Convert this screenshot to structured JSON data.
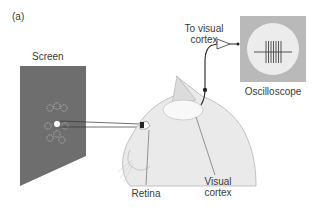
{
  "figure": {
    "panel_label": "(a)",
    "labels": {
      "screen": "Screen",
      "to_visual_cortex_line1": "To visual",
      "to_visual_cortex_line2": "cortex",
      "oscilloscope": "Oscilloscope",
      "retina": "Retina",
      "visual_cortex_line1": "Visual",
      "visual_cortex_line2": "cortex"
    },
    "colors": {
      "screen": "#6e6e6e",
      "oscilloscope_frame": "#b9b9b9",
      "oscilloscope_display": "#ececec",
      "cat_outline": "#b0b0b0",
      "cat_fill": "#e9e9e9",
      "wire": "#222222"
    }
  }
}
